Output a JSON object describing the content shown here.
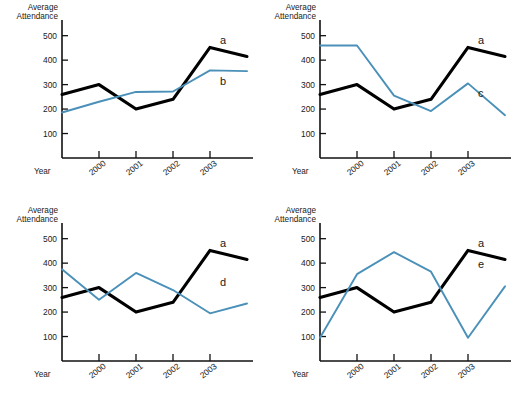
{
  "figure": {
    "axis_title_line1": "Average",
    "axis_title_line2": "Attendance",
    "x_axis_label": "Year",
    "y_ticks": [
      "500",
      "400",
      "300",
      "200",
      "100"
    ],
    "x_ticks": [
      "2000",
      "2001",
      "2002",
      "2003"
    ],
    "series_colors": {
      "black": "#000000",
      "blue": "#4a90b8"
    }
  },
  "panels": [
    {
      "id": "top-left",
      "label_a": "a",
      "label_other": "b"
    },
    {
      "id": "top-right",
      "label_a": "a",
      "label_other": "c"
    },
    {
      "id": "bottom-left",
      "label_a": "a",
      "label_other": "d"
    },
    {
      "id": "bottom-right",
      "label_a": "a",
      "label_other": "e"
    }
  ],
  "chart_data": [
    {
      "type": "line",
      "title": "",
      "panel": "top-left",
      "xlabel": "Year",
      "ylabel": "Average Attendance",
      "x": [
        "",
        "2000",
        "2001",
        "2002",
        "2003",
        ""
      ],
      "tick_labels": [
        "2000",
        "2001",
        "2002",
        "2003"
      ],
      "ylim": [
        0,
        560
      ],
      "yticks": [
        100,
        200,
        300,
        400,
        500
      ],
      "grid": false,
      "legend": "inline-end-labels",
      "series": [
        {
          "name": "a",
          "color": "#000000",
          "values": [
            260,
            300,
            200,
            240,
            452,
            415
          ]
        },
        {
          "name": "b",
          "color": "#4a90b8",
          "values": [
            186,
            230,
            270,
            272,
            358,
            355
          ]
        }
      ]
    },
    {
      "type": "line",
      "title": "",
      "panel": "top-right",
      "xlabel": "Year",
      "ylabel": "Average Attendance",
      "x": [
        "",
        "2000",
        "2001",
        "2002",
        "2003",
        ""
      ],
      "tick_labels": [
        "2000",
        "2001",
        "2002",
        "2003"
      ],
      "ylim": [
        0,
        560
      ],
      "yticks": [
        100,
        200,
        300,
        400,
        500
      ],
      "grid": false,
      "legend": "inline-end-labels",
      "series": [
        {
          "name": "a",
          "color": "#000000",
          "values": [
            260,
            300,
            200,
            240,
            452,
            415
          ]
        },
        {
          "name": "c",
          "color": "#4a90b8",
          "values": [
            460,
            460,
            255,
            192,
            305,
            175
          ]
        }
      ]
    },
    {
      "type": "line",
      "title": "",
      "panel": "bottom-left",
      "xlabel": "Year",
      "ylabel": "Average Attendance",
      "x": [
        "",
        "2000",
        "2001",
        "2002",
        "2003",
        ""
      ],
      "tick_labels": [
        "2000",
        "2001",
        "2002",
        "2003"
      ],
      "ylim": [
        0,
        560
      ],
      "yticks": [
        100,
        200,
        300,
        400,
        500
      ],
      "grid": false,
      "legend": "inline-end-labels",
      "series": [
        {
          "name": "a",
          "color": "#000000",
          "values": [
            260,
            300,
            200,
            240,
            452,
            415
          ]
        },
        {
          "name": "d",
          "color": "#4a90b8",
          "values": [
            375,
            250,
            360,
            290,
            195,
            235
          ]
        }
      ]
    },
    {
      "type": "line",
      "title": "",
      "panel": "bottom-right",
      "xlabel": "Year",
      "ylabel": "Average Attendance",
      "x": [
        "",
        "2000",
        "2001",
        "2002",
        "2003",
        ""
      ],
      "tick_labels": [
        "2000",
        "2001",
        "2002",
        "2003"
      ],
      "ylim": [
        0,
        560
      ],
      "yticks": [
        100,
        200,
        300,
        400,
        500
      ],
      "grid": false,
      "legend": "inline-end-labels",
      "series": [
        {
          "name": "a",
          "color": "#000000",
          "values": [
            260,
            300,
            200,
            240,
            452,
            415
          ]
        },
        {
          "name": "e",
          "color": "#4a90b8",
          "values": [
            95,
            355,
            445,
            365,
            95,
            305
          ]
        }
      ]
    }
  ]
}
